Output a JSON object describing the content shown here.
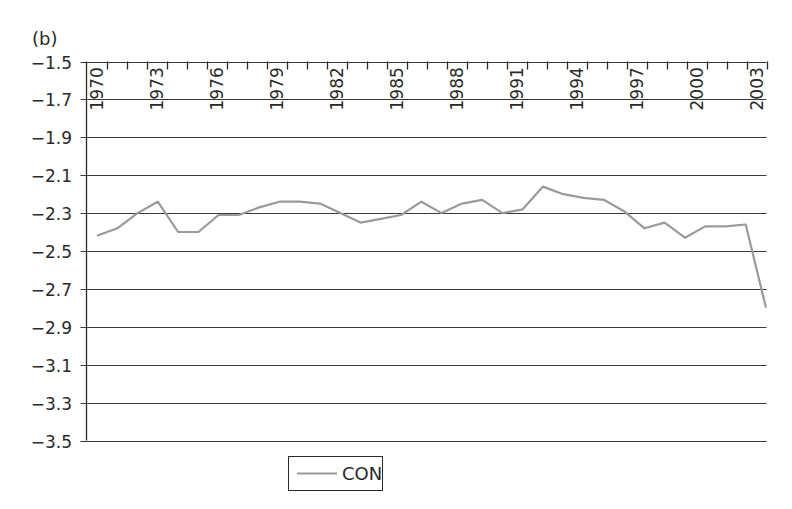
{
  "panel_label": "(b)",
  "colors": {
    "series_line": "#9a9a9a",
    "grid": "#3a3a3a",
    "axis": "#2a2a2a",
    "text": "#2a2a2a",
    "background": "#ffffff"
  },
  "chart_data": {
    "type": "line",
    "title": "",
    "panel_label": "(b)",
    "xlabel": "",
    "ylabel": "",
    "ylim": [
      -3.5,
      -1.5
    ],
    "y_ticks": [
      -1.5,
      -1.7,
      -1.9,
      -2.1,
      -2.3,
      -2.5,
      -2.7,
      -2.9,
      -3.1,
      -3.3,
      -3.5
    ],
    "y_tick_labels": [
      "−1.5",
      "−1.7",
      "−1.9",
      "−2.1",
      "−2.3",
      "−2.5",
      "−2.7",
      "−2.9",
      "−3.1",
      "−3.3",
      "−3.5"
    ],
    "x_tick_labels": [
      "1970",
      "1973",
      "1976",
      "1979",
      "1982",
      "1985",
      "1988",
      "1991",
      "1994",
      "1997",
      "2000",
      "2003"
    ],
    "x_axis_position": "top",
    "x_labels_rotated": true,
    "grid": "horizontal",
    "legend_position": "bottom",
    "x": [
      1970,
      1971,
      1972,
      1973,
      1974,
      1975,
      1976,
      1977,
      1978,
      1979,
      1980,
      1981,
      1982,
      1983,
      1984,
      1985,
      1986,
      1987,
      1988,
      1989,
      1990,
      1991,
      1992,
      1993,
      1994,
      1995,
      1996,
      1997,
      1998,
      1999,
      2000,
      2001,
      2002,
      2003
    ],
    "series": [
      {
        "name": "CON",
        "values": [
          -2.42,
          -2.38,
          -2.3,
          -2.24,
          -2.4,
          -2.4,
          -2.31,
          -2.31,
          -2.27,
          -2.24,
          -2.24,
          -2.25,
          -2.3,
          -2.35,
          -2.33,
          -2.31,
          -2.24,
          -2.3,
          -2.25,
          -2.23,
          -2.3,
          -2.28,
          -2.16,
          -2.2,
          -2.22,
          -2.23,
          -2.29,
          -2.38,
          -2.35,
          -2.43,
          -2.37,
          -2.37,
          -2.36,
          -2.8
        ]
      }
    ]
  },
  "legend": {
    "items": [
      {
        "label": "CON"
      }
    ]
  }
}
